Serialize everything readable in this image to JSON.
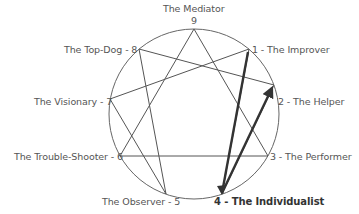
{
  "diagram": {
    "colors": {
      "circle": "#666666",
      "lines": "#555555",
      "highlight": "#333333",
      "text": "#555555",
      "highlight_text": "#333333"
    },
    "points": [
      {
        "number": 9,
        "label": "The Mediator",
        "number_label": "9"
      },
      {
        "number": 1,
        "label": "1 - The Improver"
      },
      {
        "number": 2,
        "label": "2 - The Helper"
      },
      {
        "number": 3,
        "label": "3 - The Performer"
      },
      {
        "number": 4,
        "label": "4 - The Individualist",
        "highlighted": true
      },
      {
        "number": 5,
        "label": "The Observer - 5"
      },
      {
        "number": 6,
        "label": "The Trouble-Shooter - 6"
      },
      {
        "number": 7,
        "label": "The Visionary - 7"
      },
      {
        "number": 8,
        "label": "The Top-Dog - 8"
      }
    ],
    "connections": {
      "triangle": [
        "9-3",
        "3-6",
        "6-9"
      ],
      "hexad": [
        "1-4",
        "4-2",
        "2-8",
        "8-5",
        "5-7",
        "7-1"
      ],
      "highlighted_arrows": [
        "4-1",
        "4-2"
      ]
    }
  }
}
